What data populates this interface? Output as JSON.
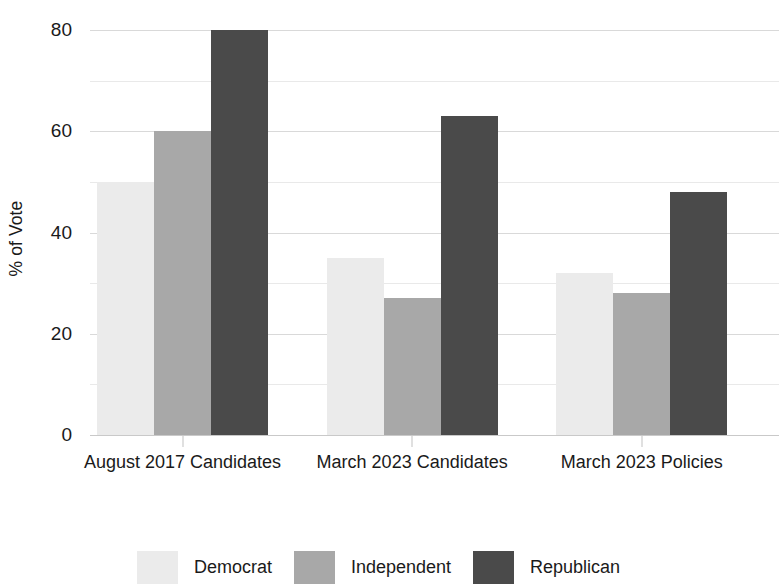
{
  "chart_data": {
    "type": "bar",
    "title": "",
    "subtitle": "",
    "xlabel": "",
    "ylabel": "% of Vote",
    "categories": [
      "August 2017 Candidates",
      "March 2023 Candidates",
      "March 2023 Policies"
    ],
    "series": [
      {
        "name": "Democrat",
        "color": "#ebebeb",
        "values": [
          50,
          60,
          80
        ]
      },
      {
        "name": "Independent",
        "color": "#a8a8a8",
        "values": [
          60,
          27,
          28
        ]
      },
      {
        "name": "Republican",
        "color": "#4a4a4a",
        "values": [
          80,
          63,
          48
        ]
      }
    ],
    "series_by_group": [
      {
        "category": "August 2017 Candidates",
        "Democrat": 50,
        "Independent": 60,
        "Republican": 80
      },
      {
        "category": "March 2023 Candidates",
        "Democrat": 35,
        "Independent": 27,
        "Republican": 63
      },
      {
        "category": "March 2023 Policies",
        "Democrat": 32,
        "Independent": 28,
        "Republican": 48
      }
    ],
    "ylim": [
      0,
      80
    ],
    "ytick_labels": [
      "0",
      "20",
      "40",
      "60",
      "80"
    ],
    "ytick_values": [
      0,
      20,
      40,
      60,
      80
    ],
    "minor_gridline_values": [
      10,
      30,
      50,
      70
    ],
    "grid": true,
    "legend_position": "bottom",
    "legend_entries": [
      "Democrat",
      "Independent",
      "Republican"
    ],
    "colors": {
      "democrat": "#ebebeb",
      "independent": "#a8a8a8",
      "republican": "#4a4a4a",
      "gridline": "#d9d9d9",
      "text": "#1a1a1a"
    }
  }
}
